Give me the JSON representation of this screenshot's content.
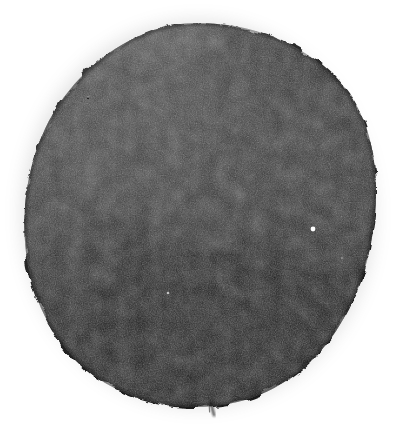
{
  "image": {
    "kind": "scanned-halftone-blob",
    "title": "Dark circular ink blob on white background",
    "caption": "",
    "width_px": 402,
    "height_px": 436,
    "background_color": "#ffffff",
    "has_text": false,
    "has_border": false
  },
  "subject": {
    "name": "blob",
    "description": "Irregular near-circular dark mass with rough grainy halftone texture",
    "center_x": 198,
    "center_y": 214,
    "radius_x": 174,
    "radius_y": 191,
    "bounds": {
      "left": 24,
      "top": 22,
      "right": 376,
      "bottom": 406
    },
    "base_color": "#2b2b2b",
    "darkest_color": "#141414",
    "lightest_color": "#575757",
    "edge_softness_px": 3
  },
  "tonal_regions": [
    {
      "name": "upper-left-highlight",
      "cx": 110,
      "cy": 110,
      "rx": 95,
      "ry": 85,
      "color": "#4a4a4a",
      "opacity": 0.55
    },
    {
      "name": "top-edge-light-streak",
      "cx": 160,
      "cy": 40,
      "rx": 70,
      "ry": 22,
      "color": "#606060",
      "opacity": 0.5
    },
    {
      "name": "left-midtone",
      "cx": 70,
      "cy": 200,
      "rx": 60,
      "ry": 95,
      "color": "#3f3f3f",
      "opacity": 0.45
    },
    {
      "name": "upper-center-midtone",
      "cx": 215,
      "cy": 120,
      "rx": 110,
      "ry": 70,
      "color": "#3a3a3a",
      "opacity": 0.35
    },
    {
      "name": "right-midtone",
      "cx": 330,
      "cy": 180,
      "rx": 55,
      "ry": 95,
      "color": "#3d3d3d",
      "opacity": 0.4
    },
    {
      "name": "lower-center-shadow",
      "cx": 215,
      "cy": 330,
      "rx": 130,
      "ry": 80,
      "color": "#121212",
      "opacity": 0.6
    },
    {
      "name": "bottom-left-shadow",
      "cx": 120,
      "cy": 300,
      "rx": 85,
      "ry": 80,
      "color": "#1c1c1c",
      "opacity": 0.45
    },
    {
      "name": "right-lower-shadow",
      "cx": 300,
      "cy": 290,
      "rx": 70,
      "ry": 70,
      "color": "#1f1f1f",
      "opacity": 0.4
    },
    {
      "name": "center-mottle",
      "cx": 190,
      "cy": 205,
      "rx": 90,
      "ry": 70,
      "color": "#2e2e2e",
      "opacity": 0.3
    }
  ],
  "specks": [
    {
      "name": "white-pinhole-primary",
      "x": 313,
      "y": 229,
      "r": 2.4,
      "color": "#ffffff",
      "opacity": 1
    },
    {
      "name": "white-pinhole-faint",
      "x": 168,
      "y": 293,
      "r": 1.3,
      "color": "#d8d8d8",
      "opacity": 0.85
    },
    {
      "name": "white-fleck-upper-left",
      "x": 88,
      "y": 97,
      "r": 1.0,
      "color": "#bdbdbd",
      "opacity": 0.6
    },
    {
      "name": "white-fleck-right",
      "x": 342,
      "y": 258,
      "r": 1.1,
      "color": "#c4c4c4",
      "opacity": 0.55
    },
    {
      "name": "dark-fleck-top",
      "x": 88,
      "y": 98,
      "r": 1.2,
      "color": "#000000",
      "opacity": 0.7
    }
  ],
  "drip": {
    "name": "bottom-drip-tail",
    "x": 212,
    "y": 405,
    "length": 14,
    "width": 2.2,
    "color": "#1a1a1a",
    "opacity": 0.85
  },
  "texture": {
    "type": "halftone-grain",
    "grain_density": "high",
    "grain_scale_px": 1.5,
    "noise_opacity": 0.55
  }
}
